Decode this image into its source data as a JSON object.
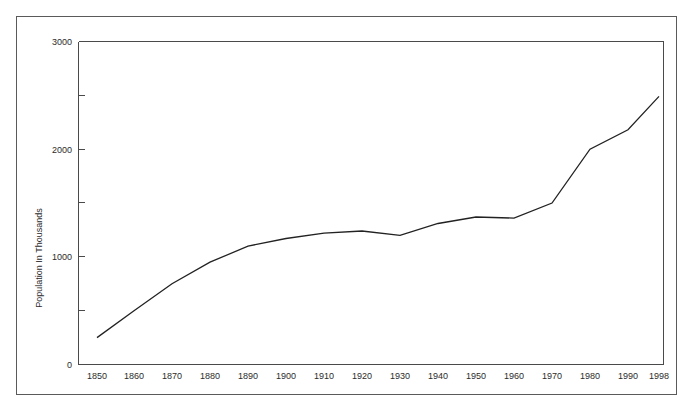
{
  "chart_data": {
    "type": "line",
    "title": "",
    "xlabel": "",
    "ylabel": "Population In Thousands",
    "x": [
      1850,
      1860,
      1870,
      1880,
      1890,
      1900,
      1910,
      1920,
      1930,
      1940,
      1950,
      1960,
      1970,
      1980,
      1990,
      1998
    ],
    "categories": [
      "1850",
      "1860",
      "1870",
      "1880",
      "1890",
      "1900",
      "1910",
      "1920",
      "1930",
      "1940",
      "1950",
      "1960",
      "1970",
      "1980",
      "1990",
      "1998"
    ],
    "values": [
      250,
      500,
      750,
      950,
      1100,
      1170,
      1220,
      1240,
      1200,
      1310,
      1370,
      1360,
      1500,
      2000,
      2180,
      2490
    ],
    "series": [
      {
        "name": "Population",
        "values": [
          250,
          500,
          750,
          950,
          1100,
          1170,
          1220,
          1240,
          1200,
          1310,
          1370,
          1360,
          1500,
          2000,
          2180,
          2490
        ]
      }
    ],
    "xlim": [
      1850,
      1998
    ],
    "ylim": [
      0,
      3000
    ],
    "y_ticks": [
      0,
      500,
      1000,
      1500,
      2000,
      2500,
      3000
    ],
    "y_tick_labels": [
      "0",
      "",
      "1000",
      "",
      "2000",
      "",
      "3000"
    ],
    "x_tick_labels": [
      "1850",
      "1860",
      "1870",
      "1880",
      "1890",
      "1900",
      "1910",
      "1920",
      "1930",
      "1940",
      "1950",
      "1960",
      "1970",
      "1980",
      "1990",
      "1998"
    ],
    "grid": false,
    "legend": null,
    "legend_position": "none",
    "line_color": "#222222",
    "axis_color": "#4a4a4a",
    "frame_color": "#5a5a5a",
    "background_color": "#ffffff",
    "annotations": []
  },
  "axis": {
    "y_title": "Population In Thousands",
    "y_labels": {
      "t0": "0",
      "t1000": "1000",
      "t2000": "2000",
      "t3000": "3000"
    },
    "x_labels": {
      "l0": "1850",
      "l1": "1860",
      "l2": "1870",
      "l3": "1880",
      "l4": "1890",
      "l5": "1900",
      "l6": "1910",
      "l7": "1920",
      "l8": "1930",
      "l9": "1940",
      "l10": "1950",
      "l11": "1960",
      "l12": "1970",
      "l13": "1980",
      "l14": "1990",
      "l15": "1998"
    }
  }
}
